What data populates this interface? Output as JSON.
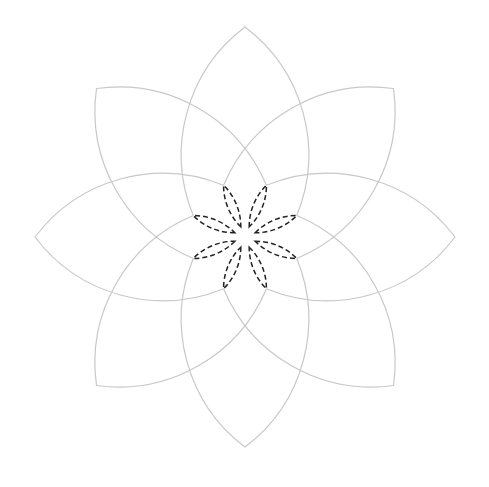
{
  "diagram": {
    "type": "geometric-flower",
    "canvas": {
      "width": 489,
      "height": 487,
      "background": "#ffffff"
    },
    "center": [
      245,
      237
    ],
    "outer_petals": {
      "count": 8,
      "start_angle_deg": -90,
      "tip_radius": 210,
      "base_radius": 56,
      "base_offset_deg": 67.5,
      "arc_radius": 160,
      "stroke": "#c8c8c8",
      "stroke_width": 1.2
    },
    "inner_petals": {
      "count": 8,
      "start_angle_deg": -67.5,
      "inner_radius": 11,
      "outer_radius": 56,
      "arc_radius": 58,
      "stroke": "#222222",
      "stroke_width": 1.5,
      "dash": "5 3"
    }
  }
}
